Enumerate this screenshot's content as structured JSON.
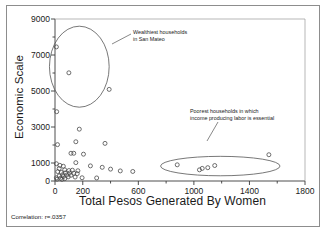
{
  "figure": {
    "x_axis_title": "Total Pesos Generated By Women",
    "y_axis_title": "Economic Scale",
    "correlation_note": "Correlation: r=.0357",
    "annotation_1": "Wealthiest households\nin San Mateo",
    "annotation_2": "Poorest households in which\nincome producing labor is essential",
    "colors": {
      "axis": "#3a3a3a",
      "marker": "#4a4a4a",
      "text": "#1a1a1a",
      "frame": "#8d8d8d",
      "background": "#ffffff"
    }
  },
  "chart_data": {
    "type": "scatter",
    "title": "",
    "xlabel": "Total Pesos Generated By Women",
    "ylabel": "Economic Scale",
    "xlim": [
      0,
      1800
    ],
    "ylim": [
      0,
      9000
    ],
    "xticks": [
      0,
      200,
      400,
      600,
      800,
      1000,
      1200,
      1400,
      1600,
      1800
    ],
    "xtick_labels": [
      "0",
      "200",
      "",
      "600",
      "",
      "1000",
      "",
      "1400",
      "",
      "1800"
    ],
    "yticks": [
      0,
      1000,
      2000,
      3000,
      4000,
      5000,
      6000,
      7000,
      8000,
      9000
    ],
    "ytick_labels": [
      "0",
      "1000",
      "",
      "3000",
      "",
      "5000",
      "",
      "7000",
      "",
      "9000"
    ],
    "grid": false,
    "legend": "none",
    "marker": "open-circle",
    "correlation": 0.0357,
    "points": [
      [
        10,
        7450
      ],
      [
        100,
        6010
      ],
      [
        390,
        5090
      ],
      [
        12,
        3850
      ],
      [
        175,
        2880
      ],
      [
        150,
        2180
      ],
      [
        360,
        2090
      ],
      [
        18,
        2020
      ],
      [
        115,
        1540
      ],
      [
        135,
        1540
      ],
      [
        205,
        1490
      ],
      [
        150,
        1020
      ],
      [
        10,
        960
      ],
      [
        35,
        870
      ],
      [
        60,
        820
      ],
      [
        255,
        840
      ],
      [
        340,
        760
      ],
      [
        400,
        660
      ],
      [
        470,
        560
      ],
      [
        560,
        530
      ],
      [
        30,
        690
      ],
      [
        70,
        620
      ],
      [
        100,
        580
      ],
      [
        125,
        600
      ],
      [
        165,
        570
      ],
      [
        20,
        520
      ],
      [
        45,
        480
      ],
      [
        75,
        450
      ],
      [
        105,
        440
      ],
      [
        135,
        430
      ],
      [
        160,
        410
      ],
      [
        55,
        350
      ],
      [
        85,
        330
      ],
      [
        115,
        320
      ],
      [
        30,
        280
      ],
      [
        60,
        250
      ],
      [
        95,
        230
      ],
      [
        145,
        220
      ],
      [
        195,
        180
      ],
      [
        300,
        170
      ],
      [
        10,
        180
      ],
      [
        40,
        150
      ],
      [
        70,
        130
      ],
      [
        15,
        100
      ],
      [
        50,
        90
      ],
      [
        880,
        900
      ],
      [
        1040,
        620
      ],
      [
        1060,
        700
      ],
      [
        1100,
        740
      ],
      [
        1150,
        860
      ],
      [
        1540,
        1460
      ]
    ],
    "annotation_groups": [
      {
        "label": "Wealthiest households in San Mateo",
        "shape": "circle",
        "center_data": [
          175,
          6350
        ],
        "radius_data": [
          215,
          2250
        ]
      },
      {
        "label": "Poorest households in which income producing labor is essential",
        "shape": "ellipse",
        "center_data": [
          1190,
          830
        ],
        "radius_data": [
          430,
          540
        ]
      }
    ]
  }
}
